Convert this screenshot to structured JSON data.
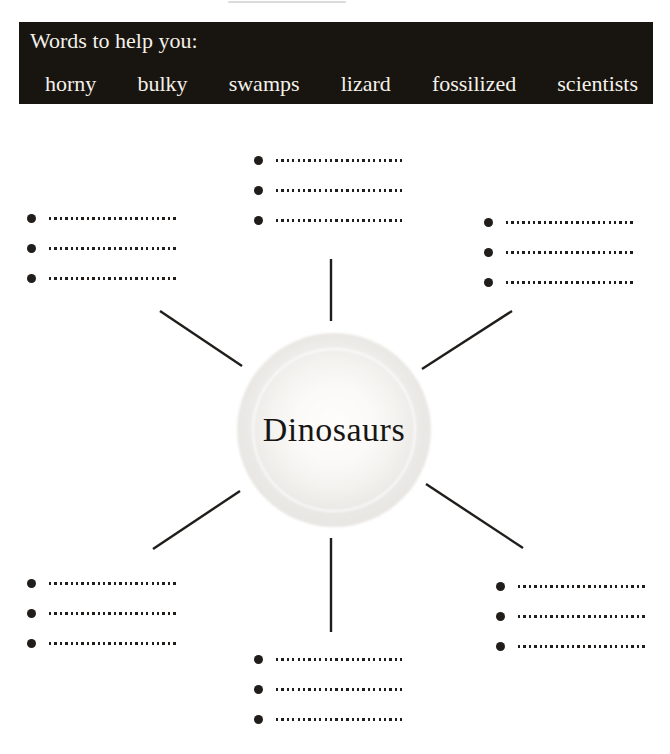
{
  "colors": {
    "page_bg": "#ffffff",
    "word_bank_bg": "#18140f",
    "word_bank_text": "#f4f1ea",
    "ink": "#201d1a",
    "bubble_outer": "#e7e5e1"
  },
  "word_bank": {
    "title": "Words to help you:",
    "words": [
      "horny",
      "bulky",
      "swamps",
      "lizard",
      "fossilized",
      "scientists"
    ]
  },
  "diagram": {
    "center_label": "Dinosaurs",
    "branches": [
      {
        "position": "top",
        "blanks": [
          "",
          "",
          ""
        ]
      },
      {
        "position": "top-left",
        "blanks": [
          "",
          "",
          ""
        ]
      },
      {
        "position": "top-right",
        "blanks": [
          "",
          "",
          ""
        ]
      },
      {
        "position": "bottom-left",
        "blanks": [
          "",
          "",
          ""
        ]
      },
      {
        "position": "bottom-right",
        "blanks": [
          "",
          "",
          ""
        ]
      },
      {
        "position": "bottom",
        "blanks": [
          "",
          "",
          ""
        ]
      }
    ]
  }
}
